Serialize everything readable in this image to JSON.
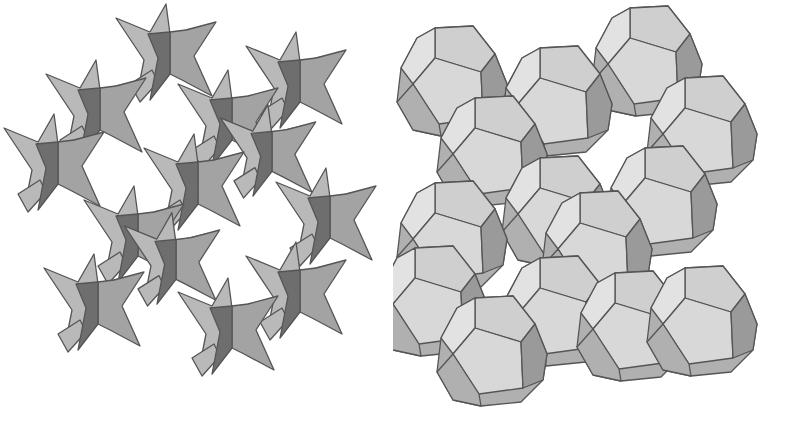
{
  "figure": {
    "background": "#ffffff",
    "panels": [
      {
        "id": "left",
        "description": "Packing of star-shaped (stellated) units viewed along a cubic axis",
        "shape": "star",
        "colors": {
          "light": "#b9b9b9",
          "mid": "#a3a3a3",
          "dark": "#6e6e6e",
          "edge": "#555555"
        },
        "units": [
          {
            "x": 170,
            "y": 62,
            "s": 1.0
          },
          {
            "x": 300,
            "y": 90,
            "s": 1.0
          },
          {
            "x": 100,
            "y": 118,
            "s": 1.0
          },
          {
            "x": 232,
            "y": 128,
            "s": 1.0
          },
          {
            "x": 272,
            "y": 160,
            "s": 0.95
          },
          {
            "x": 58,
            "y": 172,
            "s": 1.0
          },
          {
            "x": 198,
            "y": 192,
            "s": 1.0
          },
          {
            "x": 330,
            "y": 226,
            "s": 1.0
          },
          {
            "x": 138,
            "y": 244,
            "s": 1.0
          },
          {
            "x": 176,
            "y": 268,
            "s": 0.95
          },
          {
            "x": 98,
            "y": 312,
            "s": 1.0
          },
          {
            "x": 300,
            "y": 300,
            "s": 1.0
          },
          {
            "x": 232,
            "y": 336,
            "s": 1.0
          }
        ]
      },
      {
        "id": "right",
        "description": "Packing of pentagonal dodecahedra in the same arrangement",
        "shape": "dodecahedron",
        "colors": {
          "top": "#cfcfcf",
          "front": "#d8d8d8",
          "left": "#e2e2e2",
          "right": "#9a9a9a",
          "bottom": "#b0b0b0",
          "edge": "#555555"
        },
        "units": [
          {
            "x": 60,
            "y": 80,
            "s": 1.0
          },
          {
            "x": 255,
            "y": 60,
            "s": 1.0
          },
          {
            "x": 165,
            "y": 100,
            "s": 1.0
          },
          {
            "x": 310,
            "y": 130,
            "s": 1.0
          },
          {
            "x": 100,
            "y": 150,
            "s": 1.0
          },
          {
            "x": 165,
            "y": 210,
            "s": 1.0
          },
          {
            "x": 270,
            "y": 200,
            "s": 1.0
          },
          {
            "x": 60,
            "y": 235,
            "s": 1.0
          },
          {
            "x": 205,
            "y": 245,
            "s": 1.0
          },
          {
            "x": 40,
            "y": 300,
            "s": 1.0
          },
          {
            "x": 165,
            "y": 310,
            "s": 1.0
          },
          {
            "x": 240,
            "y": 325,
            "s": 1.0
          },
          {
            "x": 100,
            "y": 350,
            "s": 1.0
          },
          {
            "x": 310,
            "y": 320,
            "s": 1.0
          }
        ]
      }
    ]
  }
}
